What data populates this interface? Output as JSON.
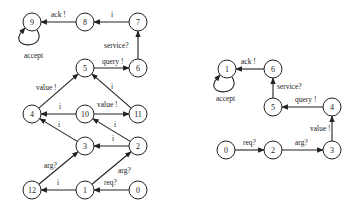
{
  "left_graph": {
    "nodes": [
      {
        "id": "9",
        "x": 32,
        "y": 22
      },
      {
        "id": "8",
        "x": 85,
        "y": 22
      },
      {
        "id": "7",
        "x": 138,
        "y": 22
      },
      {
        "id": "6",
        "x": 138,
        "y": 68
      },
      {
        "id": "5",
        "x": 85,
        "y": 68
      },
      {
        "id": "4",
        "x": 32,
        "y": 114
      },
      {
        "id": "10",
        "x": 85,
        "y": 114
      },
      {
        "id": "11",
        "x": 138,
        "y": 114
      },
      {
        "id": "3",
        "x": 85,
        "y": 146
      },
      {
        "id": "2",
        "x": 138,
        "y": 146
      },
      {
        "id": "12",
        "x": 32,
        "y": 190
      },
      {
        "id": "1",
        "x": 85,
        "y": 190
      },
      {
        "id": "0",
        "x": 138,
        "y": 190
      }
    ],
    "edges": [
      {
        "from": "0",
        "to": "1",
        "label": "req?",
        "lx": 104,
        "ly": 185
      },
      {
        "from": "1",
        "to": "12",
        "label": "i",
        "lx": 57,
        "ly": 185
      },
      {
        "from": "1",
        "to": "2",
        "label": "arg?",
        "lx": 118,
        "ly": 173
      },
      {
        "from": "12",
        "to": "3",
        "label": "arg?",
        "lx": 44,
        "ly": 168
      },
      {
        "from": "2",
        "to": "3",
        "label": "i",
        "lx": 112,
        "ly": 141
      },
      {
        "from": "2",
        "to": "10",
        "label": "i",
        "lx": 114,
        "ly": 127
      },
      {
        "from": "3",
        "to": "4",
        "label": "i",
        "lx": 58,
        "ly": 127
      },
      {
        "from": "10",
        "to": "4",
        "label": "i",
        "lx": 59,
        "ly": 109
      },
      {
        "from": "10",
        "to": "11",
        "label": "value !",
        "lx": 97,
        "ly": 107
      },
      {
        "from": "4",
        "to": "5",
        "label": "value !",
        "lx": 36,
        "ly": 90
      },
      {
        "from": "11",
        "to": "5",
        "label": "i",
        "lx": 111,
        "ly": 89
      },
      {
        "from": "5",
        "to": "6",
        "label": "query !",
        "lx": 102,
        "ly": 64
      },
      {
        "from": "6",
        "to": "7",
        "label": "service?",
        "lx": 104,
        "ly": 48
      },
      {
        "from": "7",
        "to": "8",
        "label": "i",
        "lx": 111,
        "ly": 17
      },
      {
        "from": "8",
        "to": "9",
        "label": "ack !",
        "lx": 51,
        "ly": 17
      }
    ],
    "self_loop": {
      "node": "9",
      "label": "accept",
      "lx": 24,
      "ly": 58
    }
  },
  "right_graph": {
    "nodes": [
      {
        "id": "1",
        "x": 227,
        "y": 69
      },
      {
        "id": "6",
        "x": 273,
        "y": 69
      },
      {
        "id": "5",
        "x": 273,
        "y": 107
      },
      {
        "id": "4",
        "x": 332,
        "y": 107
      },
      {
        "id": "0",
        "x": 226,
        "y": 150
      },
      {
        "id": "2",
        "x": 273,
        "y": 150
      },
      {
        "id": "3",
        "x": 332,
        "y": 150
      }
    ],
    "edges": [
      {
        "from": "0",
        "to": "2",
        "label": "req?",
        "lx": 243,
        "ly": 145
      },
      {
        "from": "2",
        "to": "3",
        "label": "arg?",
        "lx": 295,
        "ly": 145
      },
      {
        "from": "3",
        "to": "4",
        "label": "value !",
        "lx": 310,
        "ly": 131
      },
      {
        "from": "4",
        "to": "5",
        "label": "query !",
        "lx": 295,
        "ly": 102
      },
      {
        "from": "5",
        "to": "6",
        "label": "service?",
        "lx": 277,
        "ly": 89
      },
      {
        "from": "6",
        "to": "1",
        "label": "ack !",
        "lx": 241,
        "ly": 64
      }
    ],
    "self_loop": {
      "node": "1",
      "label": "accept",
      "lx": 216,
      "ly": 101
    }
  }
}
